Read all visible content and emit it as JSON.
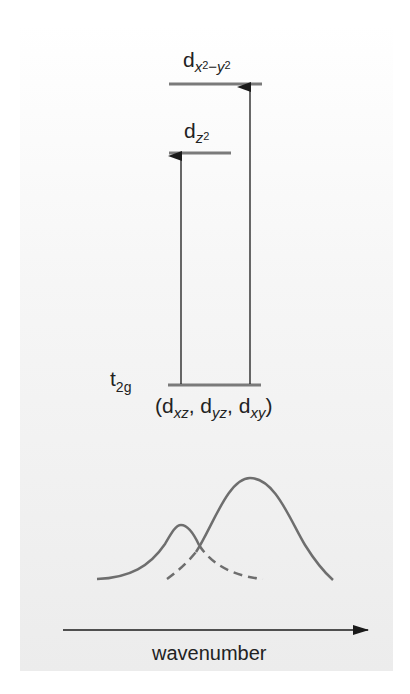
{
  "diagram": {
    "title": "",
    "colors": {
      "level_line": "#7a7a7a",
      "arrow": "#1a1a1a",
      "curve": "#6e6e6e",
      "text": "#222222",
      "panel_top": "#ffffff",
      "panel_bottom": "#ececec"
    },
    "levels": {
      "eg_upper": {
        "symbol": "d",
        "subscript": "x",
        "sup1": "2",
        "minus": "−",
        "subscript2": "y",
        "sup2": "2"
      },
      "eg_lower": {
        "symbol": "d",
        "subscript": "z",
        "sup": "2"
      },
      "t2g": {
        "symbol": "t",
        "subscript": "2g",
        "orbitals_open": "(d",
        "orb1_sub": "xz",
        "sep1": ", d",
        "orb2_sub": "yz",
        "sep2": ", d",
        "orb3_sub": "xy",
        "orbitals_close": ")"
      }
    },
    "transitions": [
      {
        "from": "t2g",
        "to": "dz2",
        "label": "lower-energy transition"
      },
      {
        "from": "t2g",
        "to": "dx2-y2",
        "label": "higher-energy transition"
      }
    ],
    "spectrum": {
      "bands": [
        {
          "name": "lower-energy band",
          "peak_x": 180,
          "style": "solid-then-dashed"
        },
        {
          "name": "higher-energy band",
          "peak_x": 250,
          "style": "dashed-then-solid"
        }
      ],
      "axis_label": "wavenumber"
    }
  }
}
